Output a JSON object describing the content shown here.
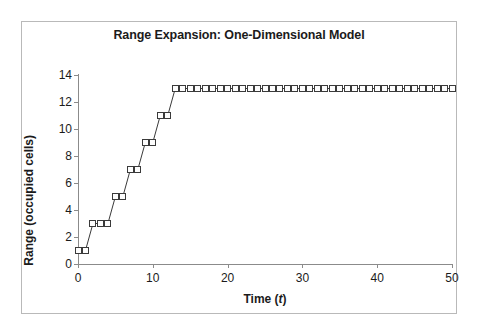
{
  "chart_data": {
    "type": "line",
    "title": "Range Expansion: One-Dimensional Model",
    "xlabel": "Time (t)",
    "xlabel_plain": "Time (",
    "xlabel_italic": "t",
    "xlabel_close": ")",
    "ylabel": "Range (occupied cells)",
    "xlim": [
      0,
      50
    ],
    "ylim": [
      0,
      14
    ],
    "xticks": [
      0,
      10,
      20,
      30,
      40,
      50
    ],
    "yticks": [
      0,
      2,
      4,
      6,
      8,
      10,
      12,
      14
    ],
    "grid": false,
    "legend": false,
    "marker": "open-square",
    "line_color": "#3a3a3a",
    "marker_face_color": "#fdfdfd",
    "marker_edge_color": "#3a3a3a",
    "x": [
      0,
      1,
      2,
      3,
      4,
      5,
      6,
      7,
      8,
      9,
      10,
      11,
      12,
      13,
      14,
      15,
      16,
      17,
      18,
      19,
      20,
      21,
      22,
      23,
      24,
      25,
      26,
      27,
      28,
      29,
      30,
      31,
      32,
      33,
      34,
      35,
      36,
      37,
      38,
      39,
      40,
      41,
      42,
      43,
      44,
      45,
      46,
      47,
      48,
      49,
      50
    ],
    "values": [
      1,
      1,
      3,
      3,
      3,
      5,
      5,
      7,
      7,
      9,
      9,
      11,
      11,
      13,
      13,
      13,
      13,
      13,
      13,
      13,
      13,
      13,
      13,
      13,
      13,
      13,
      13,
      13,
      13,
      13,
      13,
      13,
      13,
      13,
      13,
      13,
      13,
      13,
      13,
      13,
      13,
      13,
      13,
      13,
      13,
      13,
      13,
      13,
      13,
      13,
      13
    ],
    "series": [
      {
        "name": "Range (occupied cells)",
        "values": [
          1,
          1,
          3,
          3,
          3,
          5,
          5,
          7,
          7,
          9,
          9,
          11,
          11,
          13,
          13,
          13,
          13,
          13,
          13,
          13,
          13,
          13,
          13,
          13,
          13,
          13,
          13,
          13,
          13,
          13,
          13,
          13,
          13,
          13,
          13,
          13,
          13,
          13,
          13,
          13,
          13,
          13,
          13,
          13,
          13,
          13,
          13,
          13,
          13,
          13,
          13
        ]
      }
    ]
  }
}
